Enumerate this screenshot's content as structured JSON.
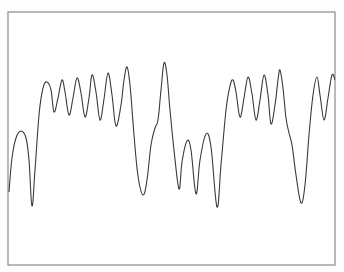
{
  "chart_data": {
    "type": "line",
    "title": "",
    "xlabel": "",
    "ylabel": "",
    "grid": false,
    "legend": null,
    "axes_visible": false,
    "frame": {
      "left": 8,
      "top": 12,
      "right": 335,
      "bottom": 265,
      "color": "#8a8a8a"
    },
    "line_color": "#3a3a3a",
    "background": "#fdfdfd",
    "points_px": [
      [
        9,
        192
      ],
      [
        12,
        158
      ],
      [
        16,
        138
      ],
      [
        21,
        131
      ],
      [
        26,
        138
      ],
      [
        29,
        160
      ],
      [
        32,
        206
      ],
      [
        35,
        170
      ],
      [
        39,
        115
      ],
      [
        43,
        88
      ],
      [
        47,
        82
      ],
      [
        51,
        90
      ],
      [
        54,
        112
      ],
      [
        58,
        98
      ],
      [
        62,
        80
      ],
      [
        65,
        92
      ],
      [
        69,
        115
      ],
      [
        73,
        98
      ],
      [
        77,
        78
      ],
      [
        81,
        93
      ],
      [
        85,
        117
      ],
      [
        89,
        98
      ],
      [
        92,
        75
      ],
      [
        96,
        92
      ],
      [
        100,
        120
      ],
      [
        104,
        99
      ],
      [
        108,
        73
      ],
      [
        112,
        95
      ],
      [
        116,
        126
      ],
      [
        121,
        105
      ],
      [
        124,
        80
      ],
      [
        127,
        67
      ],
      [
        130,
        85
      ],
      [
        134,
        135
      ],
      [
        138,
        176
      ],
      [
        143,
        195
      ],
      [
        147,
        180
      ],
      [
        151,
        145
      ],
      [
        155,
        128
      ],
      [
        158,
        120
      ],
      [
        161,
        90
      ],
      [
        164,
        63
      ],
      [
        167,
        75
      ],
      [
        170,
        110
      ],
      [
        174,
        150
      ],
      [
        179,
        189
      ],
      [
        182,
        162
      ],
      [
        187,
        141
      ],
      [
        191,
        150
      ],
      [
        196,
        194
      ],
      [
        200,
        160
      ],
      [
        206,
        134
      ],
      [
        211,
        147
      ],
      [
        217,
        207
      ],
      [
        221,
        165
      ],
      [
        226,
        110
      ],
      [
        230,
        86
      ],
      [
        233,
        80
      ],
      [
        236,
        92
      ],
      [
        240,
        117
      ],
      [
        244,
        98
      ],
      [
        248,
        77
      ],
      [
        252,
        94
      ],
      [
        256,
        120
      ],
      [
        260,
        100
      ],
      [
        264,
        75
      ],
      [
        268,
        95
      ],
      [
        271,
        124
      ],
      [
        275,
        105
      ],
      [
        278,
        80
      ],
      [
        280,
        70
      ],
      [
        283,
        88
      ],
      [
        286,
        118
      ],
      [
        289,
        133
      ],
      [
        292,
        145
      ],
      [
        296,
        175
      ],
      [
        301,
        203
      ],
      [
        305,
        185
      ],
      [
        309,
        135
      ],
      [
        313,
        95
      ],
      [
        317,
        77
      ],
      [
        320,
        95
      ],
      [
        324,
        120
      ],
      [
        328,
        98
      ],
      [
        332,
        75
      ],
      [
        335,
        80
      ]
    ]
  }
}
